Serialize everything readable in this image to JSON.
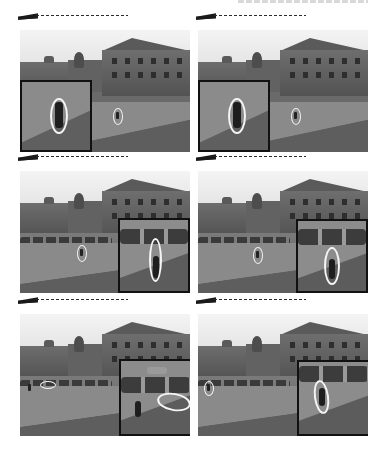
{
  "figure": {
    "layout": {
      "rows": 3,
      "columns": 2
    },
    "header_text": "",
    "panels": [
      {
        "row": 1,
        "col": 1,
        "label": "frame-1a",
        "scene": "building-and-road",
        "inset_position": "bottom-left",
        "tracked_object": "pedestrian",
        "ellipse_orientation": "vertical"
      },
      {
        "row": 1,
        "col": 2,
        "label": "frame-1b",
        "scene": "building-and-road",
        "inset_position": "bottom-left",
        "tracked_object": "pedestrian",
        "ellipse_orientation": "vertical"
      },
      {
        "row": 2,
        "col": 1,
        "label": "frame-2a",
        "scene": "parking-lot",
        "inset_position": "bottom-right",
        "tracked_object": "pedestrian",
        "ellipse_orientation": "vertical"
      },
      {
        "row": 2,
        "col": 2,
        "label": "frame-2b",
        "scene": "parking-lot",
        "inset_position": "bottom-right",
        "tracked_object": "pedestrian",
        "ellipse_orientation": "vertical"
      },
      {
        "row": 3,
        "col": 1,
        "label": "frame-3a",
        "scene": "parking-lot",
        "inset_position": "bottom-right",
        "tracked_object": "car",
        "ellipse_orientation": "horizontal"
      },
      {
        "row": 3,
        "col": 2,
        "label": "frame-3b",
        "scene": "parking-lot",
        "inset_position": "bottom-right",
        "tracked_object": "pedestrian",
        "ellipse_orientation": "vertical"
      }
    ],
    "colors": {
      "ellipse": "#f5f5f5",
      "inset_border": "#111111",
      "marker": "#1a1a1a"
    }
  }
}
